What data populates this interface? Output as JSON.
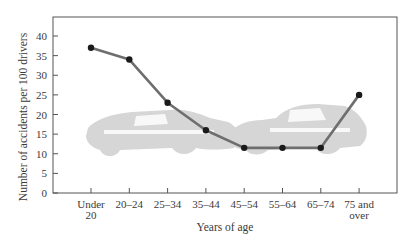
{
  "chart_data": {
    "type": "line",
    "title": "",
    "xlabel": "Years of age",
    "ylabel": "Number of accidents per 100 drivers",
    "categories": [
      "Under 20",
      "20–24",
      "25–34",
      "35–44",
      "45–54",
      "55–64",
      "65–74",
      "75 and over"
    ],
    "category_lines": [
      [
        "Under",
        "20"
      ],
      [
        "20–24"
      ],
      [
        "25–34"
      ],
      [
        "35–44"
      ],
      [
        "45–54"
      ],
      [
        "55–64"
      ],
      [
        "65–74"
      ],
      [
        "75 and",
        "over"
      ]
    ],
    "series": [
      {
        "name": "Accidents per 100 drivers",
        "values": [
          37,
          34,
          23,
          16,
          11.5,
          11.5,
          11.5,
          25
        ]
      }
    ],
    "ylim": [
      0,
      40
    ],
    "yticks": [
      0,
      5,
      10,
      15,
      20,
      25,
      30,
      35,
      40
    ],
    "grid": false,
    "legend": null,
    "background_illustration": "two-cars-colliding"
  },
  "colors": {
    "line": "#6e6e6e",
    "marker": "#1a1a1a",
    "axis": "#555555",
    "cars": "#d4d4d4",
    "text": "#3a3a3a"
  }
}
